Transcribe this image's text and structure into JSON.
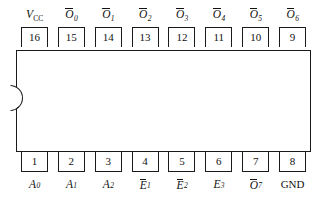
{
  "figure": {
    "package": "DIP-16",
    "notch_icon": "pin1-notch-icon"
  },
  "pins": {
    "top": [
      {
        "number": "16",
        "base": "V",
        "sub": "CC",
        "overbar": false,
        "upright": false,
        "subcaps": true
      },
      {
        "number": "15",
        "base": "O",
        "sub": "0",
        "overbar": true,
        "upright": false,
        "subcaps": false
      },
      {
        "number": "14",
        "base": "O",
        "sub": "1",
        "overbar": true,
        "upright": false,
        "subcaps": false
      },
      {
        "number": "13",
        "base": "O",
        "sub": "2",
        "overbar": true,
        "upright": false,
        "subcaps": false
      },
      {
        "number": "12",
        "base": "O",
        "sub": "3",
        "overbar": true,
        "upright": false,
        "subcaps": false
      },
      {
        "number": "11",
        "base": "O",
        "sub": "4",
        "overbar": true,
        "upright": false,
        "subcaps": false
      },
      {
        "number": "10",
        "base": "O",
        "sub": "5",
        "overbar": true,
        "upright": false,
        "subcaps": false
      },
      {
        "number": "9",
        "base": "O",
        "sub": "6",
        "overbar": true,
        "upright": false,
        "subcaps": false
      }
    ],
    "bottom": [
      {
        "number": "1",
        "base": "A",
        "sub": "0",
        "overbar": false,
        "upright": false,
        "subcaps": false
      },
      {
        "number": "2",
        "base": "A",
        "sub": "1",
        "overbar": false,
        "upright": false,
        "subcaps": false
      },
      {
        "number": "3",
        "base": "A",
        "sub": "2",
        "overbar": false,
        "upright": false,
        "subcaps": false
      },
      {
        "number": "4",
        "base": "E",
        "sub": "1",
        "overbar": true,
        "upright": false,
        "subcaps": false
      },
      {
        "number": "5",
        "base": "E",
        "sub": "2",
        "overbar": true,
        "upright": false,
        "subcaps": false
      },
      {
        "number": "6",
        "base": "E",
        "sub": "3",
        "overbar": false,
        "upright": false,
        "subcaps": false
      },
      {
        "number": "7",
        "base": "O",
        "sub": "7",
        "overbar": true,
        "upright": false,
        "subcaps": false
      },
      {
        "number": "8",
        "base": "GND",
        "sub": "",
        "overbar": false,
        "upright": true,
        "subcaps": false
      }
    ]
  }
}
